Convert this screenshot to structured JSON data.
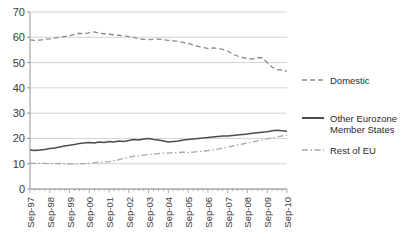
{
  "chart_data": {
    "type": "line",
    "title": "",
    "xlabel": "",
    "ylabel": "",
    "ylim": [
      0,
      70
    ],
    "ytick_step": 10,
    "yticks": [
      "0",
      "10",
      "20",
      "30",
      "40",
      "50",
      "60",
      "70"
    ],
    "grid": true,
    "legend_position": "right",
    "xticklabels": [
      "Sep-97",
      "Sep-98",
      "Sep-99",
      "Sep-00",
      "Sep-01",
      "Sep-02",
      "Sep-03",
      "Sep-04",
      "Sep-05",
      "Sep-06",
      "Sep-07",
      "Sep-08",
      "Sep-09",
      "Sep-10"
    ],
    "x_points_per_label": 4,
    "series": [
      {
        "name": "Domestic",
        "style": "dashed",
        "color": "#8a8a8a",
        "values": [
          59.0,
          58.8,
          58.9,
          59.2,
          59.4,
          59.7,
          60.0,
          60.3,
          60.6,
          61.2,
          61.6,
          61.4,
          61.8,
          62.1,
          61.6,
          61.4,
          61.2,
          61.0,
          60.8,
          60.6,
          60.3,
          60.0,
          59.4,
          59.2,
          59.1,
          59.2,
          59.3,
          59.0,
          58.8,
          58.6,
          58.3,
          58.0,
          57.6,
          57.0,
          56.4,
          56.0,
          55.6,
          55.8,
          55.6,
          55.2,
          54.6,
          53.4,
          52.6,
          52.0,
          51.6,
          51.4,
          52.0,
          51.8,
          50.0,
          48.2,
          47.2,
          47.0,
          46.6,
          46.0,
          46.4,
          47.6,
          49.4,
          51.4,
          53.0,
          54.4,
          55.0,
          54.8,
          54.6,
          54.4,
          54.0,
          53.2,
          52.6,
          52.4,
          52.2,
          52.4,
          52.6,
          52.4,
          52.2,
          52.0,
          52.2,
          52.3
        ]
      },
      {
        "name": "Other Eurozone Member States",
        "style": "solid",
        "color": "#4d4d4d",
        "values": [
          15.4,
          15.2,
          15.4,
          15.6,
          16.0,
          16.2,
          16.6,
          17.0,
          17.3,
          17.6,
          18.0,
          18.2,
          18.4,
          18.2,
          18.6,
          18.4,
          18.8,
          18.6,
          19.0,
          18.8,
          19.2,
          19.6,
          19.4,
          19.8,
          20.0,
          19.6,
          19.4,
          19.0,
          18.6,
          18.8,
          19.0,
          19.4,
          19.6,
          19.8,
          20.0,
          20.2,
          20.4,
          20.6,
          20.8,
          21.0,
          21.0,
          21.2,
          21.4,
          21.6,
          21.8,
          22.0,
          22.2,
          22.4,
          22.6,
          23.0,
          23.2,
          23.0,
          22.8,
          22.6,
          22.8,
          23.0,
          23.2,
          23.4,
          24.0,
          23.8,
          23.6,
          23.8,
          24.2,
          23.8,
          21.8,
          21.4,
          21.4,
          21.2,
          21.0,
          21.2,
          21.0,
          20.8,
          21.2,
          21.4,
          21.8,
          22.0
        ]
      },
      {
        "name": "Rest of EU",
        "style": "dashdot",
        "color": "#a8a8a8",
        "values": [
          10.2,
          10.1,
          10.2,
          10.1,
          10.0,
          10.0,
          10.1,
          10.0,
          9.9,
          9.8,
          9.9,
          10.0,
          10.2,
          10.4,
          10.6,
          10.6,
          10.8,
          11.2,
          11.6,
          12.2,
          12.6,
          13.0,
          13.2,
          13.4,
          13.6,
          13.8,
          14.0,
          14.2,
          14.2,
          14.4,
          14.4,
          14.6,
          14.4,
          14.6,
          14.8,
          15.0,
          15.2,
          15.4,
          15.8,
          16.2,
          16.6,
          17.0,
          17.4,
          17.8,
          18.2,
          18.6,
          19.0,
          19.4,
          19.8,
          20.2,
          20.6,
          21.0,
          21.2,
          20.8,
          20.6,
          21.0,
          21.4,
          21.0,
          20.4,
          19.8,
          19.2,
          18.6,
          18.0,
          17.6,
          17.2,
          16.8,
          16.4,
          16.2,
          16.4,
          16.2,
          16.0,
          16.2,
          16.6,
          16.8,
          17.2,
          17.4
        ]
      }
    ]
  },
  "legend": {
    "items": [
      {
        "label": "Domestic",
        "label2": ""
      },
      {
        "label": "Other Eurozone",
        "label2": "Member States"
      },
      {
        "label": "Rest of EU",
        "label2": ""
      }
    ]
  }
}
